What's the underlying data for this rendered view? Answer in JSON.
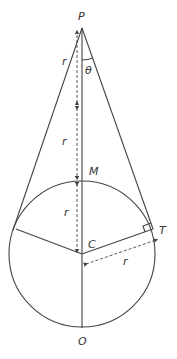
{
  "diagram": {
    "type": "geometry",
    "points": {
      "P": {
        "label": "P",
        "x": 82,
        "y": 28
      },
      "M": {
        "label": "M",
        "x": 82,
        "y": 181
      },
      "C": {
        "label": "C",
        "x": 82,
        "y": 254
      },
      "O": {
        "label": "O",
        "x": 82,
        "y": 328
      },
      "T": {
        "label": "T",
        "x": 153,
        "y": 229
      }
    },
    "angle_label": "θ",
    "radius_label": "r",
    "segment_labels": [
      "r",
      "r",
      "r",
      "r"
    ],
    "circle": {
      "cx": 82,
      "cy": 254,
      "r": 73
    },
    "colors": {
      "stroke": "#444444",
      "text": "#333333"
    }
  }
}
